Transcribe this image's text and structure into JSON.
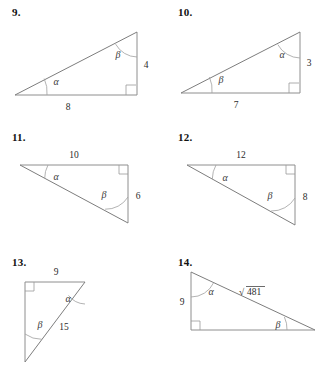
{
  "worksheet": {
    "title": "Right triangle trigonometry figures",
    "background_color": "#ffffff",
    "line_color": "#8e8e8e",
    "text_color": "#2b2b2b"
  },
  "problems": [
    {
      "number": "9.",
      "angle_alpha": "α",
      "angle_beta": "β",
      "side_base": "8",
      "side_vertical": "4",
      "right_angle_position": "bottom-right",
      "alpha_position": "bottom-left-vertex",
      "beta_position": "top-vertex"
    },
    {
      "number": "10.",
      "angle_alpha": "α",
      "angle_beta": "β",
      "side_base": "7",
      "side_vertical": "3",
      "right_angle_position": "bottom-right",
      "alpha_position": "top-vertex",
      "beta_position": "bottom-left-vertex"
    },
    {
      "number": "11.",
      "angle_alpha": "α",
      "angle_beta": "β",
      "side_top": "10",
      "side_vertical": "6",
      "right_angle_position": "top-right",
      "alpha_position": "top-left-vertex",
      "beta_position": "bottom-right-vertex"
    },
    {
      "number": "12.",
      "angle_alpha": "α",
      "angle_beta": "β",
      "side_top": "12",
      "side_vertical": "8",
      "right_angle_position": "top-right",
      "alpha_position": "top-left-vertex",
      "beta_position": "bottom-right-vertex"
    },
    {
      "number": "13.",
      "angle_alpha": "α",
      "angle_beta": "β",
      "side_top": "9",
      "side_hypotenuse": "15",
      "right_angle_position": "top-left",
      "alpha_position": "top-right-vertex",
      "beta_position": "bottom-vertex"
    },
    {
      "number": "14.",
      "angle_alpha": "α",
      "angle_beta": "β",
      "side_vertical": "9",
      "side_hypotenuse_radicand": "481",
      "side_hypotenuse_symbol": "√",
      "right_angle_position": "bottom-left",
      "alpha_position": "top-left-vertex",
      "beta_position": "bottom-right-vertex"
    }
  ]
}
